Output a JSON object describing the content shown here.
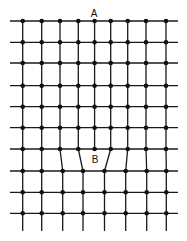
{
  "diagram": {
    "labels": [
      {
        "text": "A",
        "x": 94,
        "y": 17
      },
      {
        "text": "B",
        "x": 95,
        "y": 163
      }
    ],
    "line_color": "#1a1a1a",
    "node_color": "#111111",
    "x_extent": [
      10,
      178
    ],
    "bottom_extent": 231,
    "upper_columns": [
      22.7,
      41.7,
      60,
      78.3,
      94.6,
      110.7,
      127.7,
      146,
      166
    ],
    "lower_columns": [
      22.7,
      41.7,
      62.7,
      83,
      104.5,
      125.7,
      146.7,
      166.3
    ],
    "upper_rows": [
      21,
      42.3,
      63,
      85.7,
      106.7,
      127.7,
      149
    ],
    "lower_rows": [
      171,
      192.3,
      213.3
    ]
  }
}
